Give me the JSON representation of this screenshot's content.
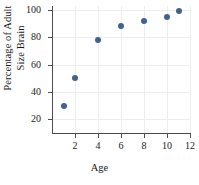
{
  "chart_data": {
    "type": "scatter",
    "title": "",
    "xlabel": "Age",
    "ylabel": "Percentage of Adult Size Brain",
    "ylabel_line1": "Percentage of Adult",
    "ylabel_line2": "Size Brain",
    "x": [
      1,
      2,
      4,
      6,
      8,
      10,
      11
    ],
    "values": [
      30,
      50,
      78,
      88,
      92,
      95,
      99
    ],
    "points": [
      {
        "x": 1,
        "y": 30
      },
      {
        "x": 2,
        "y": 50
      },
      {
        "x": 4,
        "y": 78
      },
      {
        "x": 6,
        "y": 88
      },
      {
        "x": 8,
        "y": 92
      },
      {
        "x": 10,
        "y": 95
      },
      {
        "x": 11,
        "y": 99
      }
    ],
    "xlim": [
      0,
      12
    ],
    "ylim": [
      10,
      103
    ],
    "xticks": [
      2,
      4,
      6,
      8,
      10,
      12
    ],
    "yticks": [
      20,
      40,
      60,
      80,
      100
    ],
    "grid": true,
    "legend": null,
    "marker_color": "#41618f",
    "grid_color": "#ededed",
    "axis_color": "#4d4d4d"
  }
}
